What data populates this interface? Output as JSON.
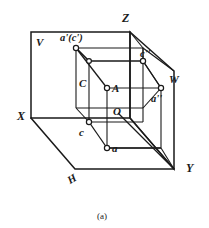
{
  "figure": {
    "caption": "(a)",
    "stroke_color": "#1a1a1a",
    "fill_color": "#ffffff",
    "background": "#ffffff",
    "type": "axonometric-projection-diagram"
  },
  "axes": {
    "z": "Z",
    "x": "X",
    "y": "Y"
  },
  "planes": {
    "v": "V",
    "h": "H",
    "w": "W"
  },
  "points": {
    "a_space": "A",
    "c_space": "C",
    "origin": "O",
    "front_projection": "a'(c')",
    "side_projection_c": "c''",
    "side_projection_a": "a''",
    "top_projection_c": "c",
    "top_projection_a": "a"
  },
  "geometry": {
    "v_plane": [
      [
        31,
        32
      ],
      [
        130,
        32
      ],
      [
        130,
        118
      ],
      [
        31,
        118
      ]
    ],
    "z_corner": [
      130,
      32
    ],
    "x_corner": [
      31,
      118
    ],
    "y_corner": [
      174,
      169
    ],
    "w_top_front": [
      130,
      32
    ],
    "w_top_back": [
      174,
      71
    ],
    "w_bottom_back": [
      174,
      169
    ],
    "w_bottom_front": [
      130,
      118
    ],
    "h_left": [
      31,
      118
    ],
    "h_front_bottom": [
      75,
      169
    ],
    "pt_a_prime": [
      76,
      48
    ],
    "pt_c_inner_top": [
      89,
      61
    ],
    "pt_c_double_prime": [
      143,
      61
    ],
    "pt_A": [
      107,
      88
    ],
    "pt_a_double_prime": [
      161,
      88
    ],
    "pt_c_lower": [
      89,
      122
    ],
    "pt_a_lower": [
      107,
      148
    ]
  }
}
